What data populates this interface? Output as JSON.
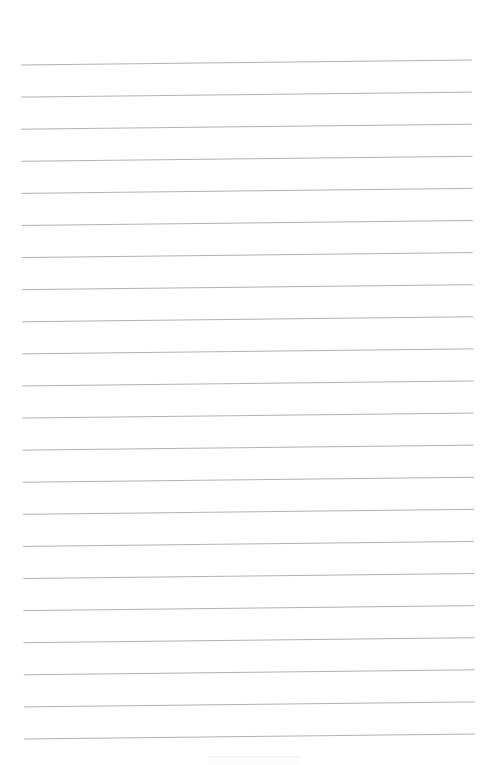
{
  "page": {
    "type": "lined-paper",
    "background_color": "#ffffff",
    "line_color": "#a9a9a9",
    "line_count": 22,
    "line_spacing_px": 32.1,
    "first_line": {
      "x1": 21,
      "y1": 65,
      "x2": 472,
      "y2": 60
    },
    "last_line": {
      "x1": 24,
      "y1": 739,
      "x2": 475,
      "y2": 734
    }
  },
  "footer": {
    "label": ""
  }
}
